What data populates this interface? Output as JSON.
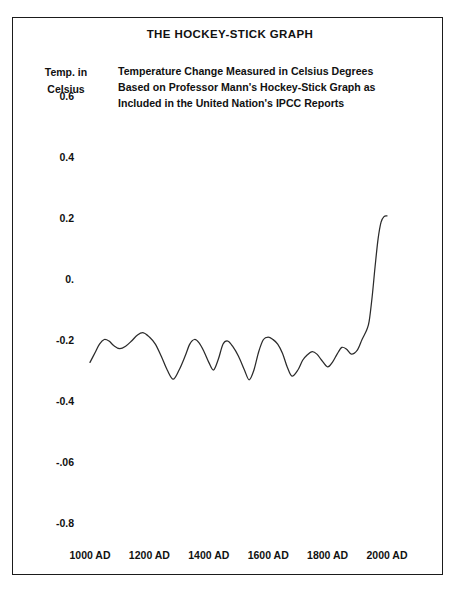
{
  "figure": {
    "title": "THE HOCKEY-STICK GRAPH",
    "axis_caption_line1": "Temp. in",
    "axis_caption_line2": "Celsius",
    "subtitle_line1": "Temperature Change Measured in Celsius Degrees",
    "subtitle_line2": "Based on Professor Mann's Hockey-Stick Graph as",
    "subtitle_line3": "Included in the United Nation's IPCC Reports",
    "ink_color": "#1b1b1b",
    "paper_color": "#ffffff"
  },
  "chart_data": {
    "type": "line",
    "title": "THE HOCKEY-STICK GRAPH",
    "subtitle": "Temperature Change Measured in Celsius Degrees Based on Professor Mann's Hockey-Stick Graph as Included in the United Nation's IPCC Reports",
    "xlabel": "",
    "ylabel": "Temp. in Celsius",
    "grid": false,
    "legend": "none",
    "xlim": [
      1000,
      2000
    ],
    "ylim": [
      -0.8,
      0.6
    ],
    "xtick_labels": [
      "1000 AD",
      "1200 AD",
      "1400 AD",
      "1600 AD",
      "1800 AD",
      "2000 AD"
    ],
    "xtick_values": [
      1000,
      1200,
      1400,
      1600,
      1800,
      2000
    ],
    "ytick_labels": [
      "0.6",
      "0.4",
      "0.2",
      "0.",
      "-0.2",
      "-0.4",
      "-.06",
      "-0.8"
    ],
    "ytick_values": [
      0.6,
      0.4,
      0.2,
      0.0,
      -0.2,
      -0.4,
      -0.6,
      -0.8
    ],
    "series": [
      {
        "name": "Northern Hemisphere temperature anomaly",
        "x": [
          1000,
          1016,
          1032,
          1048,
          1064,
          1080,
          1100,
          1120,
          1140,
          1160,
          1180,
          1200,
          1220,
          1240,
          1260,
          1280,
          1300,
          1320,
          1336,
          1352,
          1368,
          1384,
          1400,
          1416,
          1432,
          1448,
          1464,
          1480,
          1500,
          1520,
          1536,
          1552,
          1568,
          1584,
          1600,
          1616,
          1632,
          1648,
          1664,
          1680,
          1700,
          1716,
          1732,
          1748,
          1764,
          1780,
          1800,
          1816,
          1832,
          1848,
          1864,
          1880,
          1900,
          1916,
          1932,
          1940,
          1950,
          1960,
          1970,
          1980,
          1990,
          2000
        ],
        "y": [
          -0.275,
          -0.245,
          -0.215,
          -0.2,
          -0.205,
          -0.22,
          -0.23,
          -0.222,
          -0.205,
          -0.185,
          -0.178,
          -0.192,
          -0.215,
          -0.255,
          -0.3,
          -0.33,
          -0.3,
          -0.255,
          -0.215,
          -0.2,
          -0.212,
          -0.24,
          -0.275,
          -0.3,
          -0.265,
          -0.215,
          -0.205,
          -0.222,
          -0.255,
          -0.3,
          -0.332,
          -0.3,
          -0.24,
          -0.2,
          -0.192,
          -0.2,
          -0.215,
          -0.245,
          -0.29,
          -0.32,
          -0.3,
          -0.268,
          -0.25,
          -0.24,
          -0.248,
          -0.268,
          -0.29,
          -0.275,
          -0.248,
          -0.226,
          -0.232,
          -0.248,
          -0.235,
          -0.2,
          -0.168,
          -0.14,
          -0.06,
          0.04,
          0.13,
          0.185,
          0.203,
          0.205
        ],
        "units": "degrees Celsius anomaly",
        "color": "#2b2b2b"
      }
    ]
  }
}
